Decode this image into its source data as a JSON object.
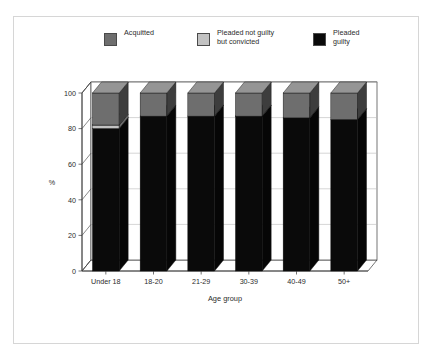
{
  "chart_data": {
    "type": "bar",
    "subtype": "stacked-3d-column",
    "title": "",
    "xlabel": "Age group",
    "ylabel": "%",
    "ylim": [
      0,
      100
    ],
    "yticks": [
      0,
      20,
      40,
      60,
      80,
      100
    ],
    "grid": true,
    "legend_position": "top",
    "stack_order_bottom_to_top": [
      "Pleaded guilty",
      "Pleaded not guilty but convicted",
      "Acquitted"
    ],
    "categories": [
      "Under 18",
      "18-20",
      "21-29",
      "30-39",
      "40-49",
      "50+"
    ],
    "series": [
      {
        "name": "Pleaded guilty",
        "color": "#0a0a0a",
        "values": [
          80,
          87,
          87,
          87,
          86,
          85
        ]
      },
      {
        "name": "Pleaded not guilty but convicted",
        "color": "#c2c2c2",
        "values": [
          2,
          0,
          0,
          0,
          0,
          0
        ]
      },
      {
        "name": "Acquitted",
        "color": "#6e6e6e",
        "values": [
          18,
          13,
          13,
          13,
          14,
          15
        ]
      }
    ]
  },
  "legend": {
    "items": [
      {
        "label": "Acquitted",
        "color": "#6e6e6e"
      },
      {
        "label": "Pleaded not guilty\nbut convicted",
        "label_line1": "Pleaded not guilty",
        "label_line2": "but convicted",
        "color": "#c2c2c2"
      },
      {
        "label": "Pleaded\nguilty",
        "label_line1": "Pleaded",
        "label_line2": "guilty",
        "color": "#0a0a0a"
      }
    ]
  },
  "axes": {
    "y_label": "%",
    "y_ticks": [
      "0",
      "20",
      "40",
      "60",
      "80",
      "100"
    ],
    "x_label": "Age group",
    "x_ticks": [
      "Under 18",
      "18-20",
      "21-29",
      "30-39",
      "40-49",
      "50+"
    ]
  },
  "colors": {
    "acquitted": "#6e6e6e",
    "not_guilty_convicted": "#c2c2c2",
    "guilty": "#0a0a0a",
    "frame": "#d6d6d6",
    "axis": "#3a3a3a",
    "grid": "#b8b8b8"
  }
}
